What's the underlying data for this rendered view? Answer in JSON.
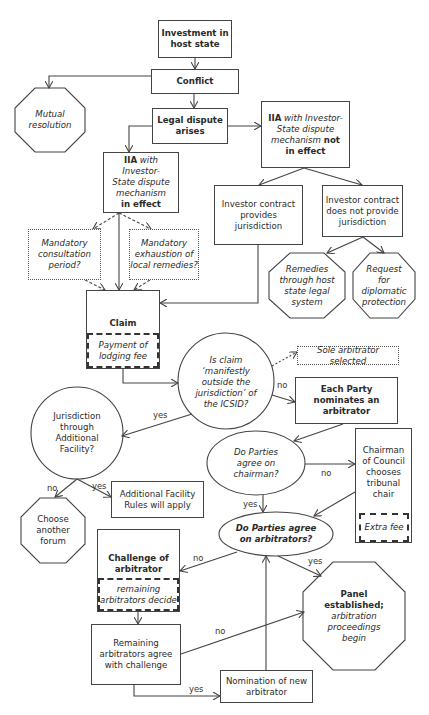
{
  "diagram": {
    "nodes": {
      "investment": {
        "line1": "Investment in",
        "line2": "host state"
      },
      "conflict": {
        "label": "Conflict"
      },
      "mutual_resolution": {
        "line1": "Mutual",
        "line2": "resolution"
      },
      "legal_dispute": {
        "line1": "Legal dispute",
        "line2": "arises"
      },
      "iia_not_in_effect": {
        "bold1": "IIA",
        "ital1": " with Investor-",
        "ital2": "State dispute",
        "ital3": "mechanism",
        "bold2": " not",
        "bold3": "in effect"
      },
      "iia_in_effect": {
        "bold1": "IIA",
        "ital1": " with Investor-",
        "ital2": "State dispute",
        "ital3": "mechanism",
        "bold2": "in effect"
      },
      "contract_provides": {
        "line1": "Investor contract",
        "line2": "provides",
        "line3": "jurisdiction"
      },
      "contract_not_provides": {
        "line1": "Investor contract",
        "line2": "does not provide",
        "line3": "jurisdiction"
      },
      "remedies_host_state": {
        "line1": "Remedies",
        "line2": "through host",
        "line3": "state legal",
        "line4": "system"
      },
      "diplomatic_protection": {
        "line1": "Request",
        "line2": "for",
        "line3": "diplomatic",
        "line4": "protection"
      },
      "mandatory_consultation": {
        "line1": "Mandatory",
        "line2": "consultation",
        "line3": "period?"
      },
      "mandatory_exhaustion": {
        "line1": "Mandatory",
        "line2": "exhaustion of",
        "line3": "local remedies?"
      },
      "claim": {
        "label": "Claim",
        "sub1": "Payment of",
        "sub2": "lodging fee"
      },
      "manifestly_outside": {
        "line1": "Is claim",
        "line2": "‘manifestly",
        "line3": "outside the",
        "line4": "jurisdiction’ of",
        "line5": "the ICSID?"
      },
      "sole_arbitrator": {
        "label": "Sole arbitrator selected"
      },
      "each_party": {
        "line1": "Each Party",
        "line2": "nominates an",
        "line3": "arbitrator"
      },
      "jurisdiction_af": {
        "line1": "Jurisdiction",
        "line2": "through",
        "line3": "Additional",
        "line4": "Facility?"
      },
      "agree_chairman": {
        "line1": "Do Parties",
        "line2": "agree on",
        "line3": "chairman?"
      },
      "chairman_council": {
        "line1": "Chairman",
        "line2": "of Council",
        "line3": "chooses",
        "line4": "tribunal",
        "line5": "chair",
        "sub": "Extra fee"
      },
      "af_rules": {
        "line1": "Additional Facility",
        "line2": "Rules will apply"
      },
      "another_forum": {
        "line1": "Choose",
        "line2": "another",
        "line3": "forum"
      },
      "agree_arbitrators": {
        "line1": "Do Parties agree",
        "line2": "on arbitrators?"
      },
      "challenge": {
        "line1": "Challenge of",
        "line2": "arbitrator",
        "sub1": "remaining",
        "sub2": "arbitrators decide"
      },
      "panel_established": {
        "bold1": "Panel",
        "bold2": "established;",
        "ital1": "arbitration",
        "ital2": "proceedings",
        "ital3": "begin"
      },
      "remaining_agree": {
        "line1": "Remaining",
        "line2": "arbitrators agree",
        "line3": "with challenge"
      },
      "nomination_new": {
        "line1": "Nomination of new",
        "line2": "arbitrator"
      }
    },
    "edge_labels": {
      "manifest_no": "no",
      "manifest_yes": "yes",
      "af_no": "no",
      "af_yes": "yes",
      "chairman_no": "no",
      "chairman_yes": "yes",
      "arbitrators_no": "no",
      "arbitrators_yes": "yes",
      "remaining_no": "no",
      "remaining_yes": "yes"
    },
    "colors": {
      "line": "#444444",
      "text": "#2a2a2a",
      "background": "#ffffff"
    }
  }
}
